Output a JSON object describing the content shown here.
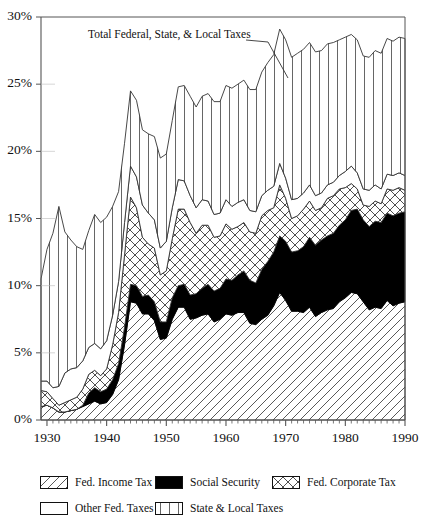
{
  "chart_data": {
    "type": "area",
    "title": "",
    "subtitle": "",
    "xlabel": "",
    "ylabel": "",
    "stacked": true,
    "grid": false,
    "legend_position": "bottom",
    "xlim": [
      1929,
      1990
    ],
    "ylim": [
      0,
      30
    ],
    "x_tick_labels": [
      "1930",
      "1940",
      "1950",
      "1960",
      "1970",
      "1980",
      "1990"
    ],
    "x_ticks": [
      1930,
      1940,
      1950,
      1960,
      1970,
      1980,
      1990
    ],
    "y_tick_labels": [
      "0%",
      "5%",
      "10%",
      "15%",
      "20%",
      "25%",
      "30%"
    ],
    "y_ticks": [
      0,
      5,
      10,
      15,
      20,
      25,
      30
    ],
    "minor_x_tick_interval": 1,
    "annotations": [
      {
        "text": "Total Federal, State, & Local Taxes",
        "x": 1946.5,
        "y": 28.2
      }
    ],
    "x": [
      1929,
      1930,
      1931,
      1932,
      1933,
      1934,
      1935,
      1936,
      1937,
      1938,
      1939,
      1940,
      1941,
      1942,
      1943,
      1944,
      1945,
      1946,
      1947,
      1948,
      1949,
      1950,
      1951,
      1952,
      1953,
      1954,
      1955,
      1956,
      1957,
      1958,
      1959,
      1960,
      1961,
      1962,
      1963,
      1964,
      1965,
      1966,
      1967,
      1968,
      1969,
      1970,
      1971,
      1972,
      1973,
      1974,
      1975,
      1976,
      1977,
      1978,
      1979,
      1980,
      1981,
      1982,
      1983,
      1984,
      1985,
      1986,
      1987,
      1988,
      1989,
      1990
    ],
    "series": [
      {
        "name": "Fed. Income Tax",
        "pattern": "diagonal-hatch",
        "values": [
          1.0,
          1.1,
          0.9,
          0.6,
          0.6,
          0.7,
          0.8,
          1.0,
          1.2,
          1.4,
          1.2,
          1.3,
          1.9,
          3.0,
          5.6,
          8.8,
          8.7,
          7.9,
          7.9,
          7.4,
          6.0,
          6.1,
          7.5,
          8.4,
          8.4,
          7.5,
          7.6,
          7.8,
          7.9,
          7.3,
          7.5,
          7.9,
          7.8,
          8.0,
          8.0,
          7.2,
          7.1,
          7.5,
          7.8,
          8.5,
          9.5,
          8.9,
          8.1,
          8.1,
          8.0,
          8.4,
          7.7,
          8.0,
          8.2,
          8.3,
          8.8,
          9.1,
          9.5,
          9.4,
          8.8,
          8.2,
          8.4,
          8.3,
          8.9,
          8.5,
          8.7,
          8.8
        ]
      },
      {
        "name": "Social Security",
        "pattern": "solid-black",
        "values": [
          0.0,
          0.0,
          0.0,
          0.0,
          0.0,
          0.0,
          0.0,
          0.1,
          0.8,
          1.0,
          0.9,
          1.0,
          1.1,
          1.2,
          1.3,
          1.3,
          1.3,
          1.3,
          1.4,
          1.4,
          1.3,
          1.2,
          1.6,
          1.6,
          1.7,
          1.8,
          1.8,
          2.0,
          2.2,
          2.3,
          2.3,
          2.6,
          2.6,
          2.8,
          3.1,
          3.2,
          3.1,
          3.7,
          4.0,
          4.0,
          4.2,
          4.4,
          4.4,
          4.5,
          4.9,
          5.2,
          5.3,
          5.4,
          5.5,
          5.6,
          5.7,
          5.8,
          6.1,
          6.3,
          6.1,
          6.2,
          6.4,
          6.4,
          6.5,
          6.7,
          6.7,
          6.7
        ]
      },
      {
        "name": "Fed. Corporate Tax",
        "pattern": "cross-hatch",
        "values": [
          1.2,
          1.0,
          0.7,
          0.5,
          0.7,
          0.8,
          0.9,
          1.2,
          1.4,
          1.3,
          1.2,
          1.5,
          2.6,
          3.8,
          5.4,
          6.5,
          5.8,
          4.4,
          3.8,
          4.0,
          3.5,
          3.8,
          4.4,
          5.7,
          5.6,
          5.4,
          4.5,
          4.7,
          4.4,
          4.0,
          3.9,
          4.1,
          3.8,
          3.6,
          3.6,
          3.6,
          3.7,
          4.0,
          3.8,
          3.3,
          3.8,
          3.2,
          2.5,
          2.6,
          2.8,
          2.7,
          2.6,
          2.4,
          2.8,
          2.8,
          2.7,
          2.4,
          2.0,
          1.5,
          1.1,
          1.5,
          1.5,
          1.4,
          1.8,
          1.9,
          1.9,
          1.6
        ]
      },
      {
        "name": "Other Fed. Taxes",
        "pattern": "blank",
        "values": [
          0.7,
          0.8,
          0.8,
          1.4,
          2.2,
          2.3,
          2.2,
          2.1,
          2.0,
          2.0,
          2.0,
          2.1,
          2.2,
          2.3,
          2.4,
          2.3,
          2.3,
          2.4,
          2.3,
          2.1,
          2.0,
          2.2,
          2.3,
          2.2,
          2.1,
          2.0,
          1.9,
          1.9,
          1.8,
          1.7,
          1.7,
          1.8,
          1.7,
          1.8,
          1.7,
          1.6,
          1.6,
          1.5,
          1.5,
          1.6,
          1.6,
          1.5,
          1.4,
          1.3,
          1.2,
          1.2,
          1.1,
          1.1,
          1.0,
          1.0,
          1.0,
          1.2,
          1.3,
          1.2,
          1.2,
          1.2,
          1.2,
          1.1,
          1.1,
          1.1,
          1.1,
          1.1
        ]
      },
      {
        "name": "State & Local Taxes",
        "pattern": "vertical-lines",
        "values": [
          7.6,
          9.8,
          11.5,
          13.4,
          10.5,
          9.6,
          9.0,
          8.3,
          8.7,
          9.6,
          9.4,
          9.2,
          8.1,
          6.7,
          5.9,
          5.6,
          5.7,
          5.6,
          5.9,
          6.2,
          6.7,
          6.5,
          6.5,
          6.9,
          7.1,
          7.4,
          7.5,
          7.7,
          8.0,
          8.4,
          8.3,
          8.5,
          8.8,
          8.8,
          8.9,
          9.0,
          9.1,
          9.2,
          9.5,
          9.8,
          10.0,
          10.3,
          10.6,
          10.8,
          10.7,
          10.6,
          10.7,
          10.6,
          10.5,
          10.4,
          10.1,
          10.0,
          9.8,
          9.9,
          9.9,
          9.9,
          10.0,
          10.1,
          10.1,
          10.0,
          10.1,
          10.2
        ]
      }
    ],
    "total_label": "Total Federal, State, & Local Taxes",
    "total": [
      10.5,
      12.7,
      13.9,
      15.9,
      14.0,
      13.4,
      12.9,
      12.7,
      14.1,
      15.3,
      14.7,
      15.1,
      15.9,
      17.0,
      20.6,
      24.5,
      23.8,
      21.6,
      21.3,
      21.1,
      19.5,
      19.8,
      22.3,
      24.8,
      24.9,
      24.1,
      23.3,
      24.1,
      24.3,
      23.7,
      23.7,
      24.9,
      24.7,
      25.0,
      25.3,
      24.6,
      24.6,
      25.9,
      26.6,
      27.2,
      29.1,
      28.3,
      27.0,
      27.3,
      27.6,
      28.1,
      27.4,
      27.5,
      28.0,
      28.1,
      28.3,
      28.5,
      28.7,
      28.3,
      27.1,
      27.0,
      27.5,
      27.3,
      28.4,
      28.2,
      28.5,
      28.4
    ]
  },
  "axes": {
    "y_labels": [
      "30%",
      "25%",
      "20%",
      "15%",
      "10%",
      "5%",
      "0%"
    ],
    "x_labels": [
      "1930",
      "1940",
      "1950",
      "1960",
      "1970",
      "1980",
      "1990"
    ]
  },
  "annotation": {
    "total_line_label": "Total Federal, State, & Local Taxes"
  },
  "legend": {
    "row1": [
      {
        "label": "Fed. Income Tax",
        "pattern": "diagonal-hatch"
      },
      {
        "label": "Social Security",
        "pattern": "solid-black"
      },
      {
        "label": "Fed. Corporate Tax",
        "pattern": "cross-hatch"
      }
    ],
    "row2": [
      {
        "label": "Other Fed. Taxes",
        "pattern": "blank"
      },
      {
        "label": "State & Local Taxes",
        "pattern": "vertical-lines"
      }
    ]
  },
  "colors": {
    "ink": "#111111",
    "fill": "#ffffff",
    "black_series": "#000000"
  }
}
